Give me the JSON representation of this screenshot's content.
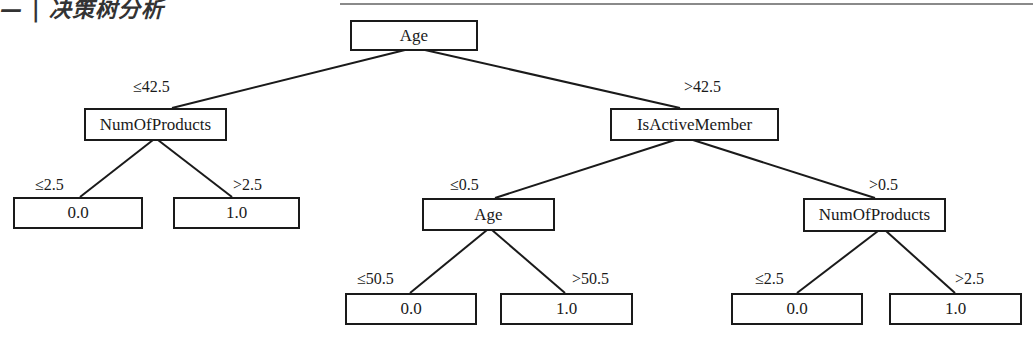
{
  "header": {
    "title": "— | 决策树分析"
  },
  "tree": {
    "nodes": {
      "root": {
        "label": "Age"
      },
      "left": {
        "label": "NumOfProducts"
      },
      "right": {
        "label": "IsActiveMember"
      },
      "left_left": {
        "label": "0.0"
      },
      "left_right": {
        "label": "1.0"
      },
      "right_left": {
        "label": "Age"
      },
      "right_right": {
        "label": "NumOfProducts"
      },
      "rl_left": {
        "label": "0.0"
      },
      "rl_right": {
        "label": "1.0"
      },
      "rr_left": {
        "label": "0.0"
      },
      "rr_right": {
        "label": "1.0"
      }
    },
    "edges": {
      "root_left": "≤42.5",
      "root_right": ">42.5",
      "left_left": "≤2.5",
      "left_right": ">2.5",
      "right_left": "≤0.5",
      "right_right": ">0.5",
      "rl_left": "≤50.5",
      "rl_right": ">50.5",
      "rr_left": "≤2.5",
      "rr_right": ">2.5"
    }
  }
}
